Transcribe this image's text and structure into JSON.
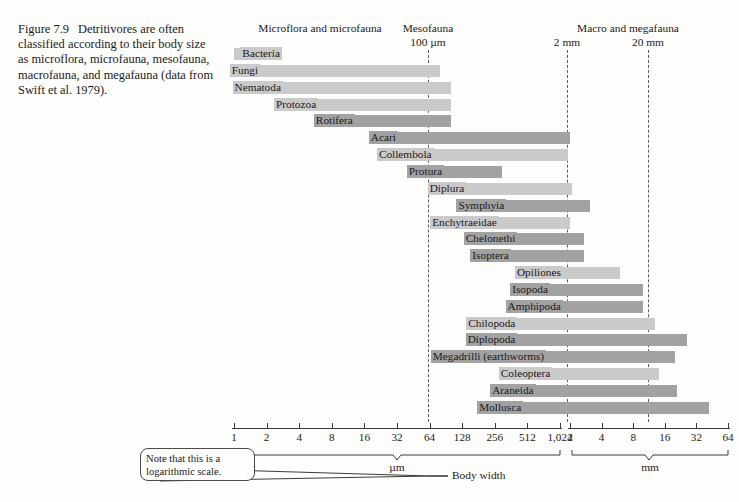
{
  "caption": {
    "figure_number": "Figure 7.9",
    "text": "Detritivores are often classified according to their body size as microflora, microfauna, mesofauna, macrofauna, and megafauna (data from Swift et al. 1979)."
  },
  "groups": [
    {
      "name": "microflora-microfauna",
      "label": "Microflora and microfauna"
    },
    {
      "name": "mesofauna",
      "label": "Mesofauna",
      "boundary": "100 µm"
    },
    {
      "name": "macro-megafauna",
      "label": "Macro and megafauna",
      "boundary_low": "2 mm",
      "boundary_high": "20 mm"
    }
  ],
  "boundaries": [
    {
      "label": "100 µm",
      "x": 428
    },
    {
      "label": "2 mm",
      "x": 567
    },
    {
      "label": "20 mm",
      "x": 648
    }
  ],
  "axis": {
    "body_width_label": "Body width",
    "unit_um": "µm",
    "unit_mm": "mm",
    "um_ticks": [
      "1",
      "2",
      "4",
      "8",
      "16",
      "32",
      "64",
      "128",
      "256",
      "512",
      "1,024"
    ],
    "mm_ticks": [
      "2",
      "4",
      "8",
      "16",
      "32",
      "64"
    ],
    "scale_note": "Note that this is a logarithmic scale."
  },
  "chart_data": {
    "type": "bar",
    "xlabel": "Body width",
    "ylabel": "",
    "scale": "logarithmic",
    "x_axis_segments": [
      {
        "unit": "µm",
        "ticks": [
          1,
          2,
          4,
          8,
          16,
          32,
          64,
          128,
          256,
          512,
          1024
        ]
      },
      {
        "unit": "mm",
        "ticks": [
          2,
          4,
          8,
          16,
          32,
          64
        ]
      }
    ],
    "boundary_markers": [
      {
        "label": "100 µm",
        "value_um": 100
      },
      {
        "label": "2 mm",
        "value_um": 2000
      },
      {
        "label": "20 mm",
        "value_um": 20000
      }
    ],
    "categories": [
      "Bacteria",
      "Fungi",
      "Nematoda",
      "Protozoa",
      "Rotifera",
      "Acari",
      "Collembola",
      "Protura",
      "Diplura",
      "Symphyia",
      "Enchytraeidae",
      "Chelonethi",
      "Isoptera",
      "Opiliones",
      "Isopoda",
      "Amphipoda",
      "Chilopoda",
      "Diplopoda",
      "Megadrilli (earthworms)",
      "Coleoptera",
      "Araneida",
      "Mollusca"
    ],
    "bars": [
      {
        "taxon": "Bacteria",
        "min_um": 1,
        "max_um": 1.6,
        "shade": "light",
        "label_inside": false
      },
      {
        "taxon": "Fungi",
        "min_um": 1.6,
        "max_um": 80,
        "shade": "light",
        "label_inside": true
      },
      {
        "taxon": "Nematoda",
        "min_um": 2.6,
        "max_um": 100,
        "shade": "light",
        "label_inside": true
      },
      {
        "taxon": "Protozoa",
        "min_um": 5.5,
        "max_um": 100,
        "shade": "light",
        "label_inside": true
      },
      {
        "taxon": "Rotifera",
        "min_um": 12,
        "max_um": 100,
        "shade": "dark",
        "label_inside": true
      },
      {
        "taxon": "Acari",
        "min_um": 30,
        "max_um": 2000,
        "shade": "dark",
        "label_inside": true
      },
      {
        "taxon": "Collembola",
        "min_um": 64,
        "max_um": 1700,
        "shade": "light",
        "label_inside": true
      },
      {
        "taxon": "Protura",
        "min_um": 80,
        "max_um": 300,
        "shade": "dark",
        "label_inside": true
      },
      {
        "taxon": "Diplura",
        "min_um": 128,
        "max_um": 2100,
        "shade": "light",
        "label_inside": true
      },
      {
        "taxon": "Symphyia",
        "min_um": 300,
        "max_um": 3100,
        "shade": "dark",
        "label_inside": true
      },
      {
        "taxon": "Enchytraeidae",
        "min_um": 256,
        "max_um": 2000,
        "shade": "light",
        "label_inside": true
      },
      {
        "taxon": "Chelonethi",
        "min_um": 380,
        "max_um": 2700,
        "shade": "dark",
        "label_inside": true
      },
      {
        "taxon": "Isoptera",
        "min_um": 330,
        "max_um": 2700,
        "shade": "dark",
        "label_inside": true
      },
      {
        "taxon": "Opiliones",
        "min_um": 1000,
        "max_um": 6000,
        "shade": "light",
        "label_inside": true
      },
      {
        "taxon": "Isopoda",
        "min_um": 760,
        "max_um": 10000,
        "shade": "dark",
        "label_inside": true
      },
      {
        "taxon": "Amphipoda",
        "min_um": 1000,
        "max_um": 10000,
        "shade": "dark",
        "label_inside": true
      },
      {
        "taxon": "Chilopoda",
        "min_um": 380,
        "max_um": 13000,
        "shade": "light",
        "label_inside": true
      },
      {
        "taxon": "Diplopoda",
        "min_um": 380,
        "max_um": 26000,
        "shade": "dark",
        "label_inside": true
      },
      {
        "taxon": "Megadrilli (earthworms)",
        "min_um": 700,
        "max_um": 20000,
        "shade": "dark",
        "label_inside": true
      },
      {
        "taxon": "Coleoptera",
        "min_um": 800,
        "max_um": 14000,
        "shade": "light",
        "label_inside": true
      },
      {
        "taxon": "Araneida",
        "min_um": 560,
        "max_um": 21000,
        "shade": "dark",
        "label_inside": true
      },
      {
        "taxon": "Mollusca",
        "min_um": 430,
        "max_um": 42000,
        "shade": "dark",
        "label_inside": true
      }
    ]
  }
}
